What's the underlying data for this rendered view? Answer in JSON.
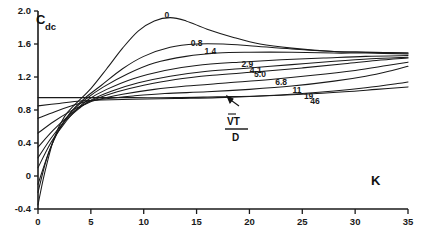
{
  "chart_data": {
    "type": "line",
    "title": "",
    "ylabel": "C/Cdc",
    "xlabel": "K",
    "xlim": [
      0,
      35
    ],
    "ylim": [
      -0.4,
      2.0
    ],
    "xticks": [
      0,
      5,
      10,
      15,
      20,
      25,
      30,
      35
    ],
    "xtick_labels": [
      "0",
      "5",
      "10",
      "15",
      "20",
      "25",
      "30",
      "35"
    ],
    "yticks": [
      -0.4,
      0,
      0.4,
      0.8,
      1.2,
      1.6,
      2.0
    ],
    "ytick_labels": [
      "-0.4",
      "0",
      "0.4",
      "0.8",
      "1.2",
      "1.6",
      "2.0"
    ],
    "grid": false,
    "legend": "inline-curve-labels",
    "parameter_name": "VT/D",
    "parameter_numerator": "VT",
    "parameter_denominator": "D",
    "annotation_note": "curve labels are values of V-bar T / D",
    "series": [
      {
        "name": "0",
        "label": "0",
        "label_x": 12.2,
        "label_y": 1.92,
        "points": [
          [
            0,
            -0.35
          ],
          [
            0.6,
            0.02
          ],
          [
            1.5,
            0.45
          ],
          [
            2.5,
            0.72
          ],
          [
            3.6,
            0.88
          ],
          [
            5,
            1.06
          ],
          [
            6.5,
            1.3
          ],
          [
            8,
            1.55
          ],
          [
            9.5,
            1.76
          ],
          [
            11,
            1.88
          ],
          [
            12.5,
            1.92
          ],
          [
            14,
            1.88
          ],
          [
            16,
            1.78
          ],
          [
            18.5,
            1.68
          ],
          [
            21,
            1.6
          ],
          [
            24,
            1.55
          ],
          [
            28,
            1.51
          ],
          [
            31,
            1.5
          ],
          [
            35,
            1.49
          ]
        ]
      },
      {
        "name": "0.8",
        "label": "0.8",
        "label_x": 15.0,
        "label_y": 1.58,
        "points": [
          [
            0,
            -0.2
          ],
          [
            0.8,
            0.2
          ],
          [
            1.8,
            0.52
          ],
          [
            3,
            0.76
          ],
          [
            4.3,
            0.93
          ],
          [
            6,
            1.1
          ],
          [
            8,
            1.3
          ],
          [
            10,
            1.45
          ],
          [
            12.5,
            1.56
          ],
          [
            15,
            1.6
          ],
          [
            17.5,
            1.6
          ],
          [
            20,
            1.58
          ],
          [
            24,
            1.54
          ],
          [
            28,
            1.51
          ],
          [
            31,
            1.5
          ],
          [
            35,
            1.49
          ]
        ]
      },
      {
        "name": "1.4",
        "label": "1.4",
        "label_x": 16.3,
        "label_y": 1.48,
        "points": [
          [
            0,
            -0.1
          ],
          [
            1,
            0.28
          ],
          [
            2,
            0.56
          ],
          [
            3.2,
            0.78
          ],
          [
            4.5,
            0.93
          ],
          [
            6.2,
            1.08
          ],
          [
            8.5,
            1.24
          ],
          [
            11,
            1.37
          ],
          [
            14,
            1.45
          ],
          [
            17,
            1.49
          ],
          [
            20,
            1.5
          ],
          [
            24,
            1.5
          ],
          [
            28,
            1.49
          ],
          [
            31,
            1.49
          ],
          [
            35,
            1.48
          ]
        ]
      },
      {
        "name": "2.9",
        "label": "2.9",
        "label_x": 19.8,
        "label_y": 1.32,
        "points": [
          [
            0,
            0.1
          ],
          [
            1.2,
            0.4
          ],
          [
            2.4,
            0.62
          ],
          [
            3.6,
            0.8
          ],
          [
            4.8,
            0.93
          ],
          [
            6.5,
            1.05
          ],
          [
            9,
            1.18
          ],
          [
            12,
            1.28
          ],
          [
            15,
            1.34
          ],
          [
            19,
            1.38
          ],
          [
            23,
            1.41
          ],
          [
            27,
            1.43
          ],
          [
            31,
            1.45
          ],
          [
            35,
            1.46
          ]
        ]
      },
      {
        "name": "4.1",
        "label": "4.1",
        "label_x": 20.6,
        "label_y": 1.25,
        "points": [
          [
            0,
            0.22
          ],
          [
            1.3,
            0.47
          ],
          [
            2.6,
            0.67
          ],
          [
            3.9,
            0.82
          ],
          [
            5,
            0.92
          ],
          [
            7,
            1.03
          ],
          [
            9.5,
            1.13
          ],
          [
            12.5,
            1.21
          ],
          [
            16,
            1.27
          ],
          [
            20,
            1.31
          ],
          [
            24,
            1.35
          ],
          [
            28,
            1.39
          ],
          [
            31.5,
            1.42
          ],
          [
            35,
            1.44
          ]
        ]
      },
      {
        "name": "5.0",
        "label": "5.0",
        "label_x": 21.0,
        "label_y": 1.2,
        "points": [
          [
            0,
            0.35
          ],
          [
            1.4,
            0.55
          ],
          [
            2.8,
            0.72
          ],
          [
            4,
            0.84
          ],
          [
            5.2,
            0.92
          ],
          [
            7.5,
            1.02
          ],
          [
            10,
            1.1
          ],
          [
            13,
            1.17
          ],
          [
            16.5,
            1.22
          ],
          [
            20.5,
            1.26
          ],
          [
            25,
            1.31
          ],
          [
            29,
            1.36
          ],
          [
            32,
            1.4
          ],
          [
            35,
            1.43
          ]
        ]
      },
      {
        "name": "6.8",
        "label": "6.8",
        "label_x": 23.0,
        "label_y": 1.1,
        "points": [
          [
            0,
            0.52
          ],
          [
            1.5,
            0.66
          ],
          [
            3,
            0.78
          ],
          [
            4.3,
            0.86
          ],
          [
            5.5,
            0.92
          ],
          [
            8,
            0.99
          ],
          [
            11,
            1.05
          ],
          [
            14,
            1.09
          ],
          [
            18,
            1.13
          ],
          [
            22,
            1.17
          ],
          [
            26,
            1.22
          ],
          [
            30,
            1.28
          ],
          [
            33,
            1.34
          ],
          [
            35,
            1.38
          ]
        ]
      },
      {
        "name": "11",
        "label": "11",
        "label_x": 24.5,
        "label_y": 1.01,
        "points": [
          [
            0,
            0.7
          ],
          [
            1.6,
            0.78
          ],
          [
            3.2,
            0.85
          ],
          [
            4.5,
            0.9
          ],
          [
            6,
            0.93
          ],
          [
            9,
            0.97
          ],
          [
            12,
            1.0
          ],
          [
            16,
            1.02
          ],
          [
            20,
            1.05
          ],
          [
            24,
            1.09
          ],
          [
            28,
            1.15
          ],
          [
            31,
            1.21
          ],
          [
            33.5,
            1.28
          ],
          [
            35,
            1.33
          ]
        ]
      },
      {
        "name": "19",
        "label": "19",
        "label_x": 25.6,
        "label_y": 0.93,
        "points": [
          [
            0,
            0.85
          ],
          [
            2,
            0.88
          ],
          [
            4,
            0.91
          ],
          [
            6,
            0.92
          ],
          [
            9,
            0.93
          ],
          [
            13,
            0.94
          ],
          [
            17,
            0.95
          ],
          [
            21,
            0.97
          ],
          [
            25,
            1.0
          ],
          [
            28,
            1.03
          ],
          [
            31,
            1.07
          ],
          [
            34,
            1.12
          ],
          [
            35,
            1.14
          ]
        ]
      },
      {
        "name": "46",
        "label": "46",
        "label_x": 26.2,
        "label_y": 0.87,
        "points": [
          [
            0,
            0.95
          ],
          [
            2,
            0.95
          ],
          [
            5,
            0.95
          ],
          [
            9,
            0.95
          ],
          [
            13,
            0.95
          ],
          [
            17,
            0.96
          ],
          [
            21,
            0.97
          ],
          [
            25,
            0.99
          ],
          [
            29,
            1.02
          ],
          [
            32,
            1.05
          ],
          [
            35,
            1.08
          ]
        ]
      }
    ]
  },
  "axes": {
    "x_axis_title": "K",
    "y_axis_title_main": "C",
    "y_axis_title_sub": "dc"
  }
}
